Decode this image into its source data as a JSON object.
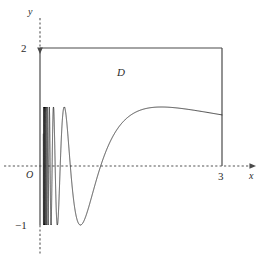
{
  "figure": {
    "title": "",
    "region_label": "D",
    "origin_label": "O",
    "axes": {
      "x_axis_label": "x",
      "y_axis_label": "y",
      "x_ticks": [
        {
          "value": 3,
          "label": "3"
        }
      ],
      "y_ticks": [
        {
          "value": 2,
          "label": "2"
        },
        {
          "value": -1,
          "label": "−1"
        }
      ]
    },
    "colors": {
      "curve": "#333333",
      "boundary": "#4a4a4a",
      "axis": "#555555",
      "text": "#2b2b2b",
      "background": "#ffffff"
    }
  },
  "chart_data": {
    "type": "line",
    "title": "",
    "xlabel": "x",
    "ylabel": "y",
    "xlim": [
      -0.65,
      3.72
    ],
    "ylim": [
      -1.5,
      2.55
    ],
    "grid": false,
    "legend": null,
    "annotations": [
      {
        "text": "D",
        "x": 1.27,
        "y": 1.45,
        "note": "region label inside bounded domain D"
      },
      {
        "text": "O",
        "x": -0.2,
        "y": -0.15,
        "note": "origin label"
      },
      {
        "text": "3",
        "x": 2.96,
        "y": -0.18,
        "note": "x tick label"
      },
      {
        "text": "2",
        "x": -0.28,
        "y": 1.98,
        "note": "y tick label"
      },
      {
        "text": "−1",
        "x": -0.38,
        "y": -1.0,
        "note": "y tick label"
      }
    ],
    "series": [
      {
        "name": "y = sin(pi/x) oscillating curve",
        "description": "Oscillating curve of sin(pi/x) type: infinitely many oscillations compressing toward x = 0, amplitude 1, meeting the x-axis at x = 3.",
        "formula": "y = sin(pi/x)",
        "x_range": [
          0,
          3
        ],
        "amplitude": 1,
        "max_value": 1,
        "min_value": -1,
        "zero_crossings": [
          3,
          1.5,
          1,
          0.75,
          0.6,
          0.5,
          0.4286,
          0.375,
          0.3333,
          0.3
        ],
        "peaks": [
          {
            "x": 2.0,
            "y": 1.0
          },
          {
            "x": 0.6667,
            "y": 1.0
          },
          {
            "x": 0.4,
            "y": 1.0
          },
          {
            "x": 0.2857,
            "y": 1.0
          },
          {
            "x": 0.2222,
            "y": 1.0
          },
          {
            "x": 0.1818,
            "y": 1.0
          }
        ],
        "troughs": [
          {
            "x": 1.2,
            "y": -1.0
          },
          {
            "x": 0.5,
            "y": -1.0
          },
          {
            "x": 0.3333,
            "y": -1.0
          },
          {
            "x": 0.25,
            "y": -1.0
          },
          {
            "x": 0.2,
            "y": -1.0
          }
        ]
      },
      {
        "name": "region boundary D",
        "description": "Rectangle-like boundary: from (0,2) horizontally to (3,2) then vertically down to (3,0).",
        "points": [
          {
            "x": 0,
            "y": 2
          },
          {
            "x": 3,
            "y": 2
          },
          {
            "x": 3,
            "y": 0
          }
        ]
      },
      {
        "name": "left boundary segment",
        "description": "Vertical solid segment of y-axis from y = 2 down to y = -1 bounding region D on the left.",
        "points": [
          {
            "x": 0,
            "y": 2
          },
          {
            "x": 0,
            "y": -1
          }
        ]
      }
    ]
  }
}
